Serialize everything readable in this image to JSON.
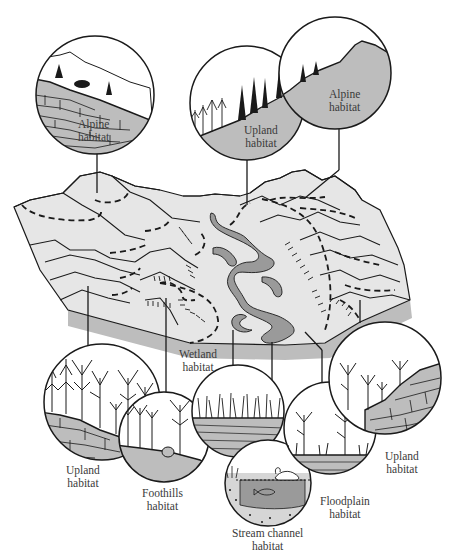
{
  "diagram": {
    "colors": {
      "ink": "#1a1a1a",
      "terrain_fill": "#e6e6e6",
      "terrain_shadow": "#bdbdbd",
      "stream_fill": "#9a9a9a",
      "circle_fill_light": "#ffffff",
      "circle_ground": "#bcbcbc",
      "background": "#ffffff"
    },
    "callouts": [
      {
        "id": "alpine-left",
        "line1": "Alpine",
        "line2": "habitat",
        "position": "top-left"
      },
      {
        "id": "upland-top",
        "line1": "Upland",
        "line2": "habitat",
        "position": "top-center"
      },
      {
        "id": "alpine-right",
        "line1": "Alpine",
        "line2": "habitat",
        "position": "top-right"
      },
      {
        "id": "upland-bottom-left",
        "line1": "Upland",
        "line2": "habitat",
        "position": "bottom-left"
      },
      {
        "id": "foothills",
        "line1": "Foothills",
        "line2": "habitat",
        "position": "bottom-left-center"
      },
      {
        "id": "wetland",
        "line1": "Wetland",
        "line2": "habitat",
        "position": "bottom-center"
      },
      {
        "id": "stream-channel",
        "line1": "Stream channel",
        "line2": "habitat",
        "position": "bottom-center"
      },
      {
        "id": "floodplain",
        "line1": "Floodplain",
        "line2": "habitat",
        "position": "bottom-right-center"
      },
      {
        "id": "upland-bottom-right",
        "line1": "Upland",
        "line2": "habitat",
        "position": "bottom-right"
      }
    ]
  }
}
